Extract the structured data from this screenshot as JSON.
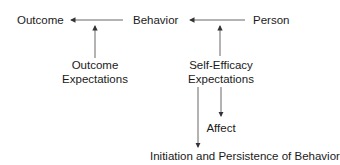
{
  "diagram": {
    "title": "",
    "nodes": {
      "outcome": "Outcome",
      "behavior": "Behavior",
      "person": "Person",
      "outcome_expectations_line1": "Outcome",
      "outcome_expectations_line2": "Expectations",
      "self_efficacy_line1": "Self-Efficacy",
      "self_efficacy_line2": "Expectations",
      "affect": "Affect",
      "initiation": "Initiation and Persistence of Behavior"
    },
    "edges": [
      {
        "from": "Behavior",
        "to": "Outcome"
      },
      {
        "from": "Person",
        "to": "Behavior"
      },
      {
        "from": "Outcome Expectations",
        "to": "Behavior-Outcome link"
      },
      {
        "from": "Self-Efficacy Expectations",
        "to": "Person-Behavior link"
      },
      {
        "from": "Self-Efficacy Expectations",
        "to": "Affect"
      },
      {
        "from": "Self-Efficacy Expectations",
        "to": "Initiation and Persistence of Behavior"
      }
    ],
    "colors": {
      "line": "#333333",
      "text": "#1a1a1a",
      "background": "#ffffff"
    }
  }
}
